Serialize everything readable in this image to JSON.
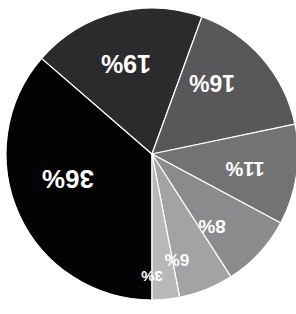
{
  "chart_data": {
    "type": "pie",
    "title": "",
    "subtitle": "",
    "xlabel": "",
    "ylabel": "",
    "legend_position": "none",
    "grid": false,
    "units": "percent",
    "rotation_note": "labels rendered rotated 180 degrees",
    "background_color": "#ffffff",
    "label_color": "#ffffff",
    "categories": [
      "36%",
      "19%",
      "16%",
      "11%",
      "8%",
      "6%",
      "3%"
    ],
    "values": [
      36,
      19,
      16,
      11,
      8,
      6,
      3
    ],
    "total": 99,
    "colors": [
      "#030303",
      "#2b2b2d",
      "#58585a",
      "#737375",
      "#8b8b8d",
      "#a3a3a5",
      "#b8b8ba"
    ],
    "slices": [
      {
        "label": "36%",
        "value": 36,
        "color": "#030303",
        "label_x": 68,
        "label_y": 178,
        "font_size": 26,
        "rotate": 180
      },
      {
        "label": "19%",
        "value": 19,
        "color": "#2b2b2d",
        "label_x": 126,
        "label_y": 63,
        "font_size": 25,
        "rotate": 180
      },
      {
        "label": "16%",
        "value": 16,
        "color": "#58585a",
        "label_x": 212,
        "label_y": 82,
        "font_size": 23,
        "rotate": 180
      },
      {
        "label": "11%",
        "value": 11,
        "color": "#737375",
        "label_x": 245,
        "label_y": 168,
        "font_size": 20,
        "rotate": 180
      },
      {
        "label": "8%",
        "value": 8,
        "color": "#8b8b8d",
        "label_x": 212,
        "label_y": 226,
        "font_size": 19,
        "rotate": 180
      },
      {
        "label": "6%",
        "value": 6,
        "color": "#a3a3a5",
        "label_x": 177,
        "label_y": 259,
        "font_size": 17,
        "rotate": 180
      },
      {
        "label": "3%",
        "value": 3,
        "color": "#b8b8ba",
        "label_x": 152,
        "label_y": 276,
        "font_size": 15,
        "rotate": 180
      }
    ],
    "geometry": {
      "center_x": 152,
      "center_y": 154,
      "radius": 146,
      "start_angle_deg": 90,
      "direction": "clockwise",
      "separator_color": "#ffffff",
      "separator_width": 1.2
    }
  }
}
